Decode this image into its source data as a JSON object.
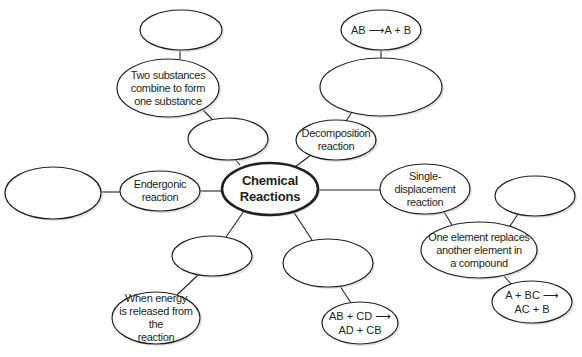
{
  "diagram": {
    "type": "concept-map",
    "title": "Chemical Reactions",
    "colors": {
      "stroke": "#231f20",
      "fill": "#ffffff",
      "text": "#231f20"
    },
    "nodes": [
      {
        "id": "center",
        "label": "Chemical\nReactions",
        "cx": 270,
        "cy": 189,
        "rx": 48,
        "ry": 26,
        "style": "center"
      },
      {
        "id": "synthesis-blank",
        "label": "",
        "cx": 228,
        "cy": 139,
        "rx": 40,
        "ry": 21
      },
      {
        "id": "synthesis-def",
        "label": "Two substances\ncombine to form\none substance",
        "cx": 168,
        "cy": 88,
        "rx": 51,
        "ry": 29
      },
      {
        "id": "synthesis-formula-blank",
        "label": "",
        "cx": 181,
        "cy": 30,
        "rx": 41,
        "ry": 20
      },
      {
        "id": "decomposition",
        "label": "Decomposition\nreaction",
        "cx": 336,
        "cy": 140,
        "rx": 40,
        "ry": 20
      },
      {
        "id": "decomposition-def-blank",
        "label": "",
        "cx": 381,
        "cy": 87,
        "rx": 61,
        "ry": 29
      },
      {
        "id": "decomposition-formula",
        "label": "AB ⟶A + B",
        "cx": 381,
        "cy": 30,
        "rx": 40,
        "ry": 20,
        "style": "formula"
      },
      {
        "id": "endergonic",
        "label": "Endergonic\nreaction",
        "cx": 160,
        "cy": 191,
        "rx": 40,
        "ry": 20
      },
      {
        "id": "endergonic-def-blank",
        "label": "",
        "cx": 53,
        "cy": 193,
        "rx": 48,
        "ry": 26
      },
      {
        "id": "single-displacement",
        "label": "Single-\ndisplacement\nreaction",
        "cx": 425,
        "cy": 189,
        "rx": 45,
        "ry": 25
      },
      {
        "id": "single-displacement-def",
        "label": "One element replaces\nanother element in\na compound",
        "cx": 479,
        "cy": 250,
        "rx": 58,
        "ry": 28
      },
      {
        "id": "single-displacement-extra-blank",
        "label": "",
        "cx": 535,
        "cy": 196,
        "rx": 40,
        "ry": 20
      },
      {
        "id": "single-displacement-formula",
        "label": "A + BC ⟶\nAC + B",
        "cx": 532,
        "cy": 302,
        "rx": 40,
        "ry": 21,
        "style": "formula"
      },
      {
        "id": "exergonic-blank",
        "label": "",
        "cx": 212,
        "cy": 256,
        "rx": 40,
        "ry": 20
      },
      {
        "id": "exergonic-def",
        "label": "When energy\nis released from the\nreaction",
        "cx": 156,
        "cy": 318,
        "rx": 44,
        "ry": 26
      },
      {
        "id": "double-displacement-blank",
        "label": "",
        "cx": 328,
        "cy": 263,
        "rx": 45,
        "ry": 24
      },
      {
        "id": "double-displacement-formula",
        "label": "AB + CD ⟶\nAD + CB",
        "cx": 360,
        "cy": 323,
        "rx": 38,
        "ry": 21,
        "style": "formula"
      }
    ],
    "edges": [
      {
        "from": "center",
        "to": "synthesis-blank",
        "x1": 240,
        "y1": 165,
        "x2": 235,
        "y2": 159
      },
      {
        "from": "synthesis-blank",
        "to": "synthesis-def",
        "x1": 212,
        "y1": 119,
        "x2": 203,
        "y2": 110
      },
      {
        "from": "synthesis-def",
        "to": "synthesis-formula-blank",
        "x1": 180,
        "y1": 59,
        "x2": 180,
        "y2": 50
      },
      {
        "from": "center",
        "to": "decomposition",
        "x1": 295,
        "y1": 167,
        "x2": 311,
        "y2": 155
      },
      {
        "from": "decomposition",
        "to": "decomposition-def-blank",
        "x1": 346,
        "y1": 121,
        "x2": 352,
        "y2": 112
      },
      {
        "from": "decomposition-def-blank",
        "to": "decomposition-formula",
        "x1": 381,
        "y1": 58,
        "x2": 381,
        "y2": 50
      },
      {
        "from": "center",
        "to": "endergonic",
        "x1": 222,
        "y1": 191,
        "x2": 200,
        "y2": 191
      },
      {
        "from": "endergonic",
        "to": "endergonic-def-blank",
        "x1": 120,
        "y1": 192,
        "x2": 101,
        "y2": 192
      },
      {
        "from": "center",
        "to": "single-displacement",
        "x1": 318,
        "y1": 190,
        "x2": 380,
        "y2": 190
      },
      {
        "from": "single-displacement",
        "to": "single-displacement-def",
        "x1": 444,
        "y1": 212,
        "x2": 452,
        "y2": 225
      },
      {
        "from": "single-displacement-def",
        "to": "single-displacement-extra-blank",
        "x1": 510,
        "y1": 226,
        "x2": 518,
        "y2": 214
      },
      {
        "from": "single-displacement-def",
        "to": "single-displacement-formula",
        "x1": 504,
        "y1": 276,
        "x2": 512,
        "y2": 285
      },
      {
        "from": "center",
        "to": "exergonic-blank",
        "x1": 244,
        "y1": 211,
        "x2": 226,
        "y2": 237
      },
      {
        "from": "exergonic-blank",
        "to": "exergonic-def",
        "x1": 198,
        "y1": 275,
        "x2": 177,
        "y2": 295
      },
      {
        "from": "center",
        "to": "double-displacement-blank",
        "x1": 293,
        "y1": 211,
        "x2": 312,
        "y2": 240
      },
      {
        "from": "double-displacement-blank",
        "to": "double-displacement-formula",
        "x1": 340,
        "y1": 286,
        "x2": 351,
        "y2": 303
      }
    ]
  }
}
